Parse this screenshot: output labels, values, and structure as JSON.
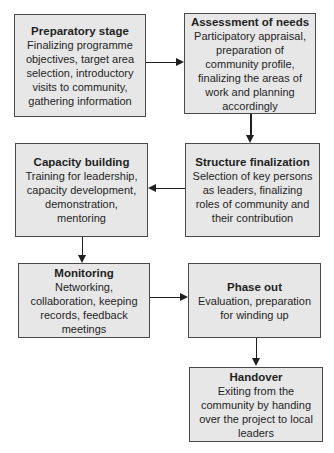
{
  "diagram": {
    "type": "flowchart",
    "background_color": "#ffffff",
    "box_fill_color": "#e7e7e7",
    "box_border_color": "#4a4a4a",
    "text_color": "#1f1f1f"
  },
  "nodes": [
    {
      "id": "preparatory-stage",
      "title": "Preparatory stage",
      "body": "Finalizing programme objectives, target area selection, introductory visits to community, gathering information"
    },
    {
      "id": "assessment-of-needs",
      "title": "Assessment of needs",
      "body": "Participatory appraisal, preparation of community profile, finalizing the areas of work and planning accordingly"
    },
    {
      "id": "capacity-building",
      "title": "Capacity building",
      "body": "Training for leadership, capacity development, demonstration, mentoring"
    },
    {
      "id": "structure-finalization",
      "title": "Structure finalization",
      "body": "Selection of key persons as leaders, finalizing roles of community and their contribution"
    },
    {
      "id": "monitoring",
      "title": "Monitoring",
      "body": "Networking, collaboration, keeping records, feedback meetings"
    },
    {
      "id": "phase-out",
      "title": "Phase out",
      "body": "Evaluation, preparation for winding up"
    },
    {
      "id": "handover",
      "title": "Handover",
      "body": "Exiting from the community by handing over the project to local leaders"
    }
  ],
  "edges": [
    {
      "from": "preparatory-stage",
      "to": "assessment-of-needs",
      "direction": "right"
    },
    {
      "from": "assessment-of-needs",
      "to": "structure-finalization",
      "direction": "down"
    },
    {
      "from": "structure-finalization",
      "to": "capacity-building",
      "direction": "left"
    },
    {
      "from": "capacity-building",
      "to": "monitoring",
      "direction": "down"
    },
    {
      "from": "monitoring",
      "to": "phase-out",
      "direction": "right"
    },
    {
      "from": "phase-out",
      "to": "handover",
      "direction": "down"
    }
  ]
}
